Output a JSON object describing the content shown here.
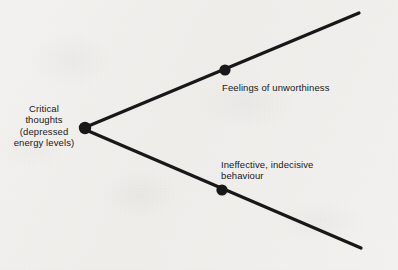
{
  "figure": {
    "type": "branching-diagram",
    "background_color": "#f1f0ee",
    "ink_color": "#18181a",
    "root": {
      "label": "Critical\nthoughts\n(depressed\nenergy levels)",
      "node": {
        "x": 85,
        "y": 128,
        "radius": 5.5
      }
    },
    "branches": [
      {
        "name": "upper-branch",
        "label": "Feelings of unworthiness",
        "node": {
          "x": 225,
          "y": 70,
          "radius": 5.5
        },
        "line": {
          "x1": 86,
          "y1": 127,
          "x2": 359,
          "y2": 13
        },
        "direction": "up-right"
      },
      {
        "name": "lower-branch",
        "label": "Ineffective, indecisive\nbehaviour",
        "node": {
          "x": 222,
          "y": 190,
          "radius": 5.5
        },
        "line": {
          "x1": 86,
          "y1": 130,
          "x2": 361,
          "y2": 248
        },
        "direction": "down-right"
      }
    ],
    "axis": {
      "label": "Amplification of critical thoughts (increased depression)",
      "orientation": "vertical-right",
      "reading_direction": "bottom-to-top"
    }
  }
}
